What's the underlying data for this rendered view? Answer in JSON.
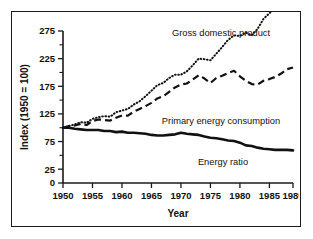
{
  "figure": {
    "border_color": "#1a1a1a",
    "background": "#ffffff"
  },
  "chart_data": {
    "type": "line",
    "title": "",
    "xlabel": "Year",
    "ylabel": "Index (1950 = 100)",
    "xlim": [
      1950,
      1989
    ],
    "ylim": [
      0,
      275
    ],
    "grid": false,
    "legend": "inline-annotations",
    "xticks": [
      1950,
      1955,
      1960,
      1965,
      1970,
      1975,
      1980,
      1985,
      1989
    ],
    "xticklabels": [
      "1950",
      "1955",
      "1960",
      "1965",
      "1970",
      "1975",
      "1980",
      "1985",
      "1989"
    ],
    "yticks": [
      0,
      25,
      75,
      125,
      175,
      225,
      275
    ],
    "yticklabels": [
      "0",
      "25",
      "75",
      "125",
      "175",
      "225",
      "275"
    ],
    "yticks_minor": [
      50,
      100,
      150,
      200,
      250
    ],
    "x": [
      1950,
      1951,
      1952,
      1953,
      1954,
      1955,
      1956,
      1957,
      1958,
      1959,
      1960,
      1961,
      1962,
      1963,
      1964,
      1965,
      1966,
      1967,
      1968,
      1969,
      1970,
      1971,
      1972,
      1973,
      1974,
      1975,
      1976,
      1977,
      1978,
      1979,
      1980,
      1981,
      1982,
      1983,
      1984,
      1985,
      1986,
      1987,
      1988,
      1989
    ],
    "series": [
      {
        "name": "Gross domestic product",
        "style": "dotted",
        "color": "#111111",
        "annotation": "Gross domestic product",
        "values": [
          100,
          103,
          106,
          110,
          109,
          116,
          119,
          121,
          120,
          128,
          131,
          134,
          142,
          148,
          157,
          167,
          177,
          181,
          190,
          196,
          196,
          202,
          213,
          225,
          224,
          222,
          234,
          246,
          259,
          267,
          266,
          272,
          267,
          279,
          297,
          307,
          318,
          331,
          345,
          357
        ]
      },
      {
        "name": "Primary energy consumption",
        "style": "dashed",
        "color": "#111111",
        "annotation": "Primary energy consumption",
        "values": [
          100,
          103,
          104,
          107,
          105,
          112,
          115,
          114,
          113,
          118,
          122,
          122,
          129,
          134,
          139,
          145,
          153,
          157,
          165,
          173,
          178,
          180,
          187,
          195,
          189,
          181,
          190,
          194,
          199,
          203,
          193,
          185,
          179,
          178,
          185,
          188,
          192,
          198,
          206,
          209
        ]
      },
      {
        "name": "Energy ratio",
        "style": "solid",
        "color": "#111111",
        "annotation": "Energy ratio",
        "values": [
          100,
          100,
          98,
          97,
          96,
          96,
          96,
          94,
          94,
          92,
          93,
          91,
          91,
          90,
          89,
          87,
          86,
          86,
          87,
          88,
          91,
          89,
          88,
          87,
          84,
          82,
          81,
          79,
          77,
          76,
          73,
          68,
          67,
          64,
          62,
          61,
          60,
          60,
          60,
          59
        ]
      }
    ],
    "annotations": [
      {
        "text": "Gross domestic product",
        "x_px": 222,
        "y_px": 36,
        "anchor": "middle"
      },
      {
        "text": "Primary energy consumption",
        "x_px": 222,
        "y_px": 124,
        "anchor": "middle"
      },
      {
        "text": "Energy ratio",
        "x_px": 224,
        "y_px": 165,
        "anchor": "middle"
      }
    ]
  }
}
